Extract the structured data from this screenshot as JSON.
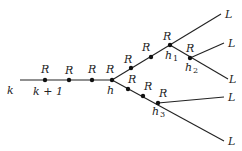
{
  "diagram": {
    "start_label": "k",
    "node_labels": {
      "k_plus_1": "k + 1",
      "h": "h",
      "h1": "h",
      "h1_sub": "1",
      "h2": "h",
      "h2_sub": "2",
      "h3": "h",
      "h3_sub": "3"
    },
    "edge_label": "R",
    "leaf_label": "L",
    "leaves": [
      "L",
      "L",
      "L",
      "L",
      "L"
    ]
  }
}
